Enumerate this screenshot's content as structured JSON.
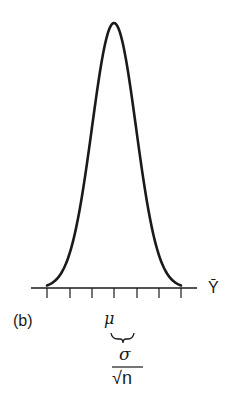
{
  "figure": {
    "panel_label": "(b)",
    "axis_label": "Ȳ",
    "center_label": "μ",
    "spread_numerator": "σ",
    "spread_denominator": "√n",
    "ticks_count": 7,
    "curve_color": "#1a1a1a"
  },
  "chart_data": {
    "type": "line",
    "title": "",
    "xlabel": "Ȳ",
    "ylabel": "",
    "x": [
      -3,
      -2,
      -1,
      0,
      1,
      2,
      3
    ],
    "tick_labels": [
      "",
      "",
      "",
      "μ",
      "",
      "",
      ""
    ],
    "series": [
      {
        "name": "density",
        "values": [
          0.011,
          0.135,
          0.607,
          1.0,
          0.607,
          0.135,
          0.011
        ]
      }
    ],
    "annotations": [
      "(b)",
      "μ",
      "σ/√n"
    ],
    "grid": false,
    "legend": "none"
  }
}
